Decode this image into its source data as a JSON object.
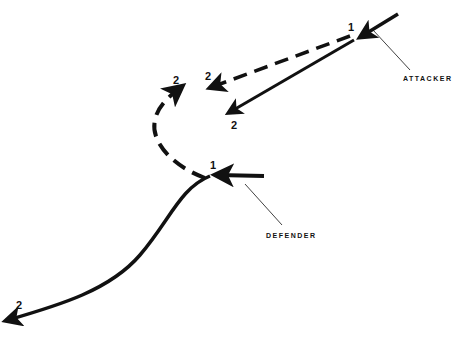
{
  "diagram": {
    "type": "maneuver-diagram",
    "attacker": {
      "label": "ATTACKER",
      "start_label": "1",
      "solid_end_label": "2",
      "dashed_end_label": "2"
    },
    "defender": {
      "label": "DEFENDER",
      "start_label": "1",
      "solid_end_label": "2",
      "dashed_end_label": "2"
    },
    "colors": {
      "line": "#111111",
      "background": "#ffffff"
    }
  }
}
